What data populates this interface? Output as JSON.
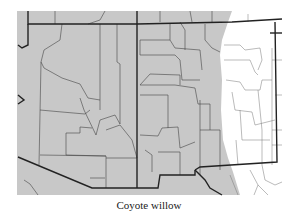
{
  "map": {
    "title": "Coyote willow",
    "range_fill": "#c8c8c8",
    "background": "#ffffff",
    "state_line_color": "#222222",
    "county_line_color": "#444444"
  }
}
